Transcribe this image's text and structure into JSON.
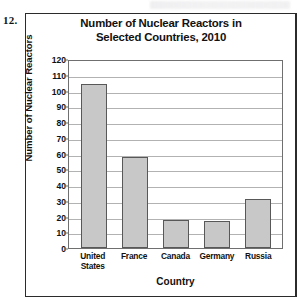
{
  "problem_number": "12.",
  "axis": {
    "y_title": "Number of Nuclear Reactors",
    "x_title": "Country"
  },
  "chart_data": {
    "type": "bar",
    "title": "Number of Nuclear Reactors in Selected Countries, 2010",
    "title_line1": "Number of Nuclear Reactors in",
    "title_line2": "Selected Countries, 2010",
    "xlabel": "Country",
    "ylabel": "Number of Nuclear Reactors",
    "ylim": [
      0,
      120
    ],
    "ytick_step": 10,
    "yticks": [
      120,
      110,
      100,
      90,
      80,
      70,
      60,
      50,
      40,
      30,
      20,
      10,
      0
    ],
    "grid": "horizontal",
    "legend": "none",
    "bar_color": "#c8c8c8",
    "bar_border_color": "#585858",
    "categories": [
      "United States",
      "France",
      "Canada",
      "Germany",
      "Russia"
    ],
    "category_lines": [
      [
        "United",
        "States"
      ],
      [
        "France"
      ],
      [
        "Canada"
      ],
      [
        "Germany"
      ],
      [
        "Russia"
      ]
    ],
    "values": [
      104,
      58,
      18,
      17,
      31
    ]
  }
}
